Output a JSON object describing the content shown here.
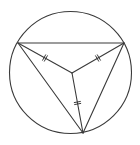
{
  "diagram": {
    "type": "geometry",
    "colors": {
      "background": "#ffffff",
      "stroke": "#3a3a3a"
    },
    "circle": {
      "cx": 70.5,
      "cy": 72.5,
      "r": 61
    },
    "points": {
      "A": {
        "x": 18,
        "y": 43
      },
      "B": {
        "x": 124,
        "y": 43
      },
      "C": {
        "x": 83,
        "y": 133
      },
      "O": {
        "x": 72,
        "y": 73
      }
    },
    "triangle_sides": [
      [
        "A",
        "B"
      ],
      [
        "B",
        "C"
      ],
      [
        "C",
        "A"
      ]
    ],
    "equal_segments": [
      {
        "from": "O",
        "to": "A",
        "ticks": 2
      },
      {
        "from": "O",
        "to": "B",
        "ticks": 2
      },
      {
        "from": "O",
        "to": "C",
        "ticks": 2
      }
    ],
    "labels": []
  }
}
